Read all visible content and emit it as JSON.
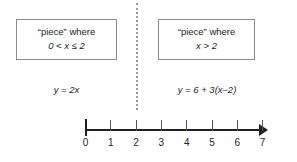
{
  "figure": {
    "divider": {
      "name": "vertical-dotted-divider",
      "style": "dotted",
      "color": "#9a9a9a",
      "x_value": 2
    }
  },
  "pieces": [
    {
      "id": "left",
      "condition_title": "“piece” where",
      "condition_range": "0 < x ≤ 2",
      "equation": "y = 2x"
    },
    {
      "id": "right",
      "condition_title": "“piece” where",
      "condition_range": "x > 2",
      "equation": "y = 6 + 3(x–2)"
    }
  ],
  "number_line": {
    "name": "number-line",
    "min": 0,
    "max": 7,
    "arrow_right": true,
    "ticks": [
      {
        "value": 0,
        "label": "0",
        "origin": true
      },
      {
        "value": 1,
        "label": "1",
        "origin": false
      },
      {
        "value": 2,
        "label": "2",
        "origin": false
      },
      {
        "value": 3,
        "label": "3",
        "origin": false
      },
      {
        "value": 4,
        "label": "4",
        "origin": false
      },
      {
        "value": 5,
        "label": "5",
        "origin": false
      },
      {
        "value": 6,
        "label": "6",
        "origin": false
      },
      {
        "value": 7,
        "label": "7",
        "origin": false
      }
    ],
    "line_color": "#231f20",
    "tick_color": "#555555"
  },
  "colors": {
    "background": "#ffffff",
    "text": "#231f20",
    "box_border": "#8d8d8d",
    "divider": "#9a9a9a"
  }
}
